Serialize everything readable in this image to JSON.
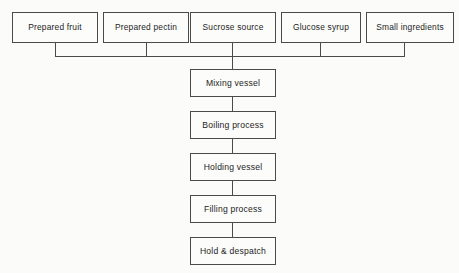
{
  "diagram": {
    "line_color": "#4a4a4a",
    "background_color": "#fbfbf9",
    "inputs": [
      {
        "label": "Prepared fruit"
      },
      {
        "label": "Prepared pectin"
      },
      {
        "label": "Sucrose source"
      },
      {
        "label": "Glucose syrup"
      },
      {
        "label": "Small ingredients"
      }
    ],
    "process_chain": [
      {
        "label": "Mixing vessel"
      },
      {
        "label": "Boiling process"
      },
      {
        "label": "Holding vessel"
      },
      {
        "label": "Filling process"
      },
      {
        "label": "Hold & despatch"
      }
    ]
  }
}
